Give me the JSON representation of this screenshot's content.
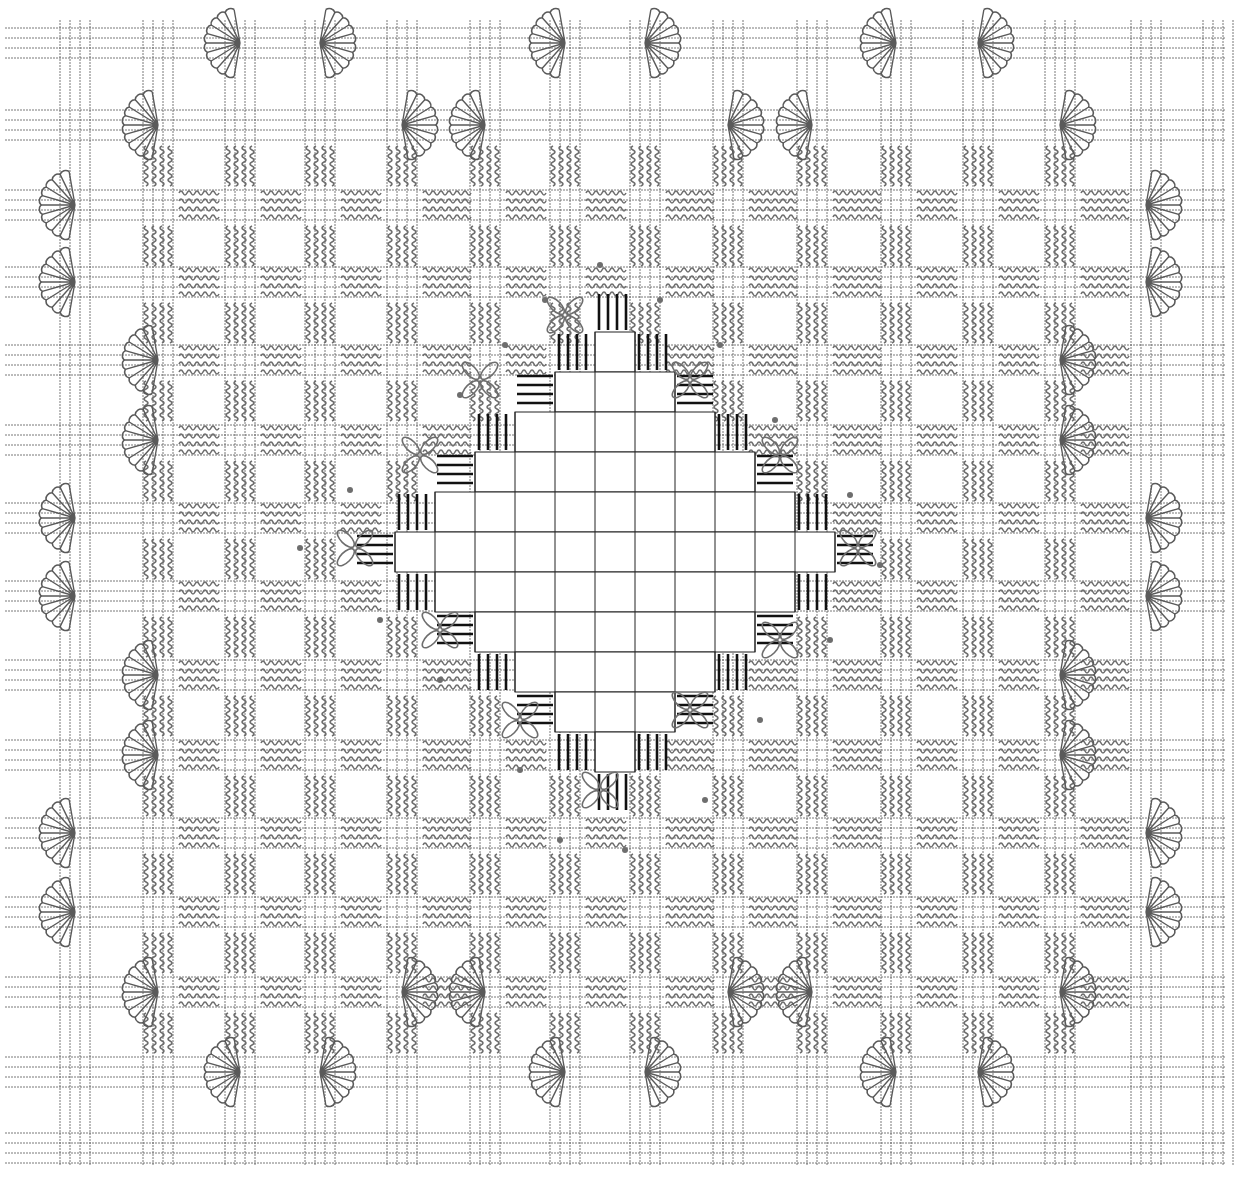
{
  "diagram": {
    "title": "",
    "type": "embroidery-pattern",
    "colors": {
      "background": "#ffffff",
      "grid_thread": "#4a4a4a",
      "stitch": "#6e6e6e",
      "fan_stitch": "#5a5a5a",
      "satin_block": "#111111",
      "cell_line": "#222222"
    },
    "grid": {
      "column_centers": [
        75,
        158,
        240,
        320,
        402,
        485,
        565,
        645,
        728,
        812,
        896,
        978,
        1060,
        1146,
        1218
      ],
      "row_centers": [
        43,
        125,
        205,
        282,
        360,
        440,
        518,
        596,
        675,
        755,
        833,
        912,
        992,
        1072,
        1148
      ],
      "band_width": 38,
      "threads_per_band": 4
    },
    "center_motif": {
      "name": "open-diamond",
      "center": [
        615,
        552
      ],
      "cell_size": 40
    },
    "legend": []
  }
}
